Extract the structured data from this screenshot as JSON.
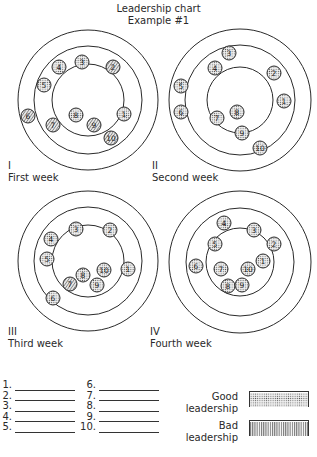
{
  "header": {
    "title": "Leadership chart",
    "subtitle": "Example #1"
  },
  "diagrams": [
    {
      "numeral": "I",
      "caption": "First week",
      "center": [
        88,
        100
      ],
      "rings": [
        70,
        54,
        36
      ],
      "members": [
        {
          "n": "1",
          "x": 124,
          "y": 114,
          "rating": "good"
        },
        {
          "n": "2",
          "x": 113,
          "y": 67,
          "rating": "bad"
        },
        {
          "n": "3",
          "x": 82,
          "y": 62,
          "rating": "good"
        },
        {
          "n": "4",
          "x": 59,
          "y": 67,
          "rating": "good"
        },
        {
          "n": "5",
          "x": 44,
          "y": 85,
          "rating": "good"
        },
        {
          "n": "6",
          "x": 28,
          "y": 116,
          "rating": "bad"
        },
        {
          "n": "7",
          "x": 53,
          "y": 125,
          "rating": "bad"
        },
        {
          "n": "8",
          "x": 76,
          "y": 115,
          "rating": "good"
        },
        {
          "n": "9",
          "x": 94,
          "y": 125,
          "rating": "bad"
        },
        {
          "n": "10",
          "x": 111,
          "y": 138,
          "rating": "bad"
        }
      ]
    },
    {
      "numeral": "II",
      "caption": "Second week",
      "center": [
        240,
        100
      ],
      "rings": [
        71,
        55,
        33
      ],
      "members": [
        {
          "n": "1",
          "x": 284,
          "y": 101,
          "rating": "good"
        },
        {
          "n": "2",
          "x": 274,
          "y": 73,
          "rating": "good"
        },
        {
          "n": "3",
          "x": 229,
          "y": 53,
          "rating": "good"
        },
        {
          "n": "4",
          "x": 215,
          "y": 68,
          "rating": "good"
        },
        {
          "n": "5",
          "x": 181,
          "y": 86,
          "rating": "good"
        },
        {
          "n": "6",
          "x": 181,
          "y": 112,
          "rating": "good"
        },
        {
          "n": "7",
          "x": 217,
          "y": 118,
          "rating": "good"
        },
        {
          "n": "8",
          "x": 237,
          "y": 112,
          "rating": "good"
        },
        {
          "n": "9",
          "x": 242,
          "y": 133,
          "rating": "good"
        },
        {
          "n": "10",
          "x": 260,
          "y": 148,
          "rating": "good"
        }
      ]
    },
    {
      "numeral": "III",
      "caption": "Third week",
      "center": [
        88,
        261
      ],
      "rings": [
        70,
        54,
        36
      ],
      "members": [
        {
          "n": "1",
          "x": 128,
          "y": 269,
          "rating": "good"
        },
        {
          "n": "2",
          "x": 110,
          "y": 230,
          "rating": "good"
        },
        {
          "n": "3",
          "x": 76,
          "y": 229,
          "rating": "good"
        },
        {
          "n": "4",
          "x": 51,
          "y": 239,
          "rating": "good"
        },
        {
          "n": "5",
          "x": 47,
          "y": 259,
          "rating": "good"
        },
        {
          "n": "6",
          "x": 53,
          "y": 298,
          "rating": "good"
        },
        {
          "n": "7",
          "x": 70,
          "y": 284,
          "rating": "bad"
        },
        {
          "n": "8",
          "x": 83,
          "y": 275,
          "rating": "good"
        },
        {
          "n": "9",
          "x": 97,
          "y": 285,
          "rating": "good"
        },
        {
          "n": "10",
          "x": 104,
          "y": 270,
          "rating": "good"
        }
      ]
    },
    {
      "numeral": "IV",
      "caption": "Fourth week",
      "center": [
        240,
        262
      ],
      "rings": [
        71,
        54,
        34
      ],
      "members": [
        {
          "n": "1",
          "x": 263,
          "y": 261,
          "rating": "good"
        },
        {
          "n": "2",
          "x": 274,
          "y": 244,
          "rating": "good"
        },
        {
          "n": "3",
          "x": 254,
          "y": 230,
          "rating": "good"
        },
        {
          "n": "4",
          "x": 224,
          "y": 223,
          "rating": "good"
        },
        {
          "n": "5",
          "x": 215,
          "y": 244,
          "rating": "good"
        },
        {
          "n": "6",
          "x": 196,
          "y": 266,
          "rating": "good"
        },
        {
          "n": "7",
          "x": 221,
          "y": 269,
          "rating": "good"
        },
        {
          "n": "8",
          "x": 228,
          "y": 286,
          "rating": "good"
        },
        {
          "n": "9",
          "x": 242,
          "y": 285,
          "rating": "good"
        },
        {
          "n": "10",
          "x": 248,
          "y": 269,
          "rating": "good"
        }
      ]
    }
  ],
  "name_blanks": {
    "left": [
      "1.",
      "2.",
      "3.",
      "4.",
      "5."
    ],
    "right": [
      "6.",
      "7.",
      "8.",
      "9.",
      "10."
    ]
  },
  "legend": {
    "good": {
      "line1": "Good",
      "line2": "leadership",
      "pattern": "dotted"
    },
    "bad": {
      "line1": "Bad",
      "line2": "leadership",
      "pattern": "vertical-hatch"
    }
  },
  "colors": {
    "ink": "#2a2a2a",
    "paper": "#ffffff",
    "dot_fill": "#d8d8d8"
  }
}
